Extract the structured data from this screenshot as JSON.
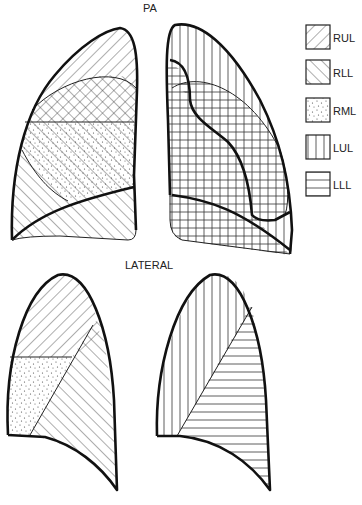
{
  "figure": {
    "views": [
      {
        "id": "pa",
        "title": "PA"
      },
      {
        "id": "lateral",
        "title": "LATERAL"
      }
    ],
    "legend": [
      {
        "code": "RUL",
        "pattern": "diagonal-back",
        "meaning": "right upper lobe"
      },
      {
        "code": "RLL",
        "pattern": "diagonal-forward",
        "meaning": "right lower lobe"
      },
      {
        "code": "RML",
        "pattern": "stipple",
        "meaning": "right middle lobe"
      },
      {
        "code": "LUL",
        "pattern": "vertical-lines",
        "meaning": "left upper lobe"
      },
      {
        "code": "LLL",
        "pattern": "horizontal-lines",
        "meaning": "left lower lobe"
      }
    ]
  },
  "labels": {
    "pa": "PA",
    "lateral": "LATERAL",
    "legend": [
      "RUL",
      "RLL",
      "RML",
      "LUL",
      "LLL"
    ]
  }
}
